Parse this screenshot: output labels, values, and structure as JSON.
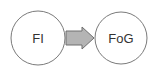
{
  "diagram": {
    "nodes": [
      {
        "id": "fi",
        "label": "FI"
      },
      {
        "id": "fog",
        "label": "FoG"
      }
    ],
    "edges": [
      {
        "from": "fi",
        "to": "fog",
        "style": "block-arrow"
      }
    ],
    "colors": {
      "node_stroke": "#7a7a7a",
      "node_fill": "#ffffff",
      "arrow_fill": "#b4b4b4",
      "arrow_stroke": "#6e6e6e",
      "text": "#333333"
    }
  }
}
